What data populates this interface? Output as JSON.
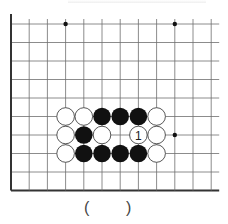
{
  "diagram": {
    "type": "go-problem",
    "board": {
      "edges_visible": [
        "left",
        "bottom"
      ],
      "columns_visible": 12,
      "rows_visible": 10,
      "origin_px": {
        "x": 11,
        "y": 24
      },
      "spacing_px": {
        "x": 18.2,
        "y": 18.5
      },
      "line_color": "#6e6e6e",
      "edge_color": "#333333",
      "star_points": [
        {
          "col": 3,
          "row": 0
        },
        {
          "col": 9,
          "row": 0
        },
        {
          "col": 9,
          "row": 6
        }
      ]
    },
    "stones": [
      {
        "col": 3,
        "row": 5,
        "color": "white",
        "label": ""
      },
      {
        "col": 4,
        "row": 5,
        "color": "white",
        "label": ""
      },
      {
        "col": 5,
        "row": 5,
        "color": "black",
        "label": ""
      },
      {
        "col": 6,
        "row": 5,
        "color": "black",
        "label": ""
      },
      {
        "col": 7,
        "row": 5,
        "color": "black",
        "label": ""
      },
      {
        "col": 8,
        "row": 5,
        "color": "white",
        "label": ""
      },
      {
        "col": 3,
        "row": 6,
        "color": "white",
        "label": ""
      },
      {
        "col": 4,
        "row": 6,
        "color": "black",
        "label": ""
      },
      {
        "col": 5,
        "row": 6,
        "color": "white",
        "label": ""
      },
      {
        "col": 7,
        "row": 6,
        "color": "white",
        "label": "1"
      },
      {
        "col": 8,
        "row": 6,
        "color": "white",
        "label": ""
      },
      {
        "col": 3,
        "row": 7,
        "color": "white",
        "label": ""
      },
      {
        "col": 4,
        "row": 7,
        "color": "black",
        "label": ""
      },
      {
        "col": 5,
        "row": 7,
        "color": "black",
        "label": ""
      },
      {
        "col": 6,
        "row": 7,
        "color": "black",
        "label": ""
      },
      {
        "col": 7,
        "row": 7,
        "color": "black",
        "label": ""
      },
      {
        "col": 8,
        "row": 7,
        "color": "white",
        "label": ""
      }
    ],
    "colors": {
      "black_stone": "#111111",
      "white_stone_fill": "#ffffff",
      "white_stone_stroke": "#444444",
      "label_color": "#222222"
    }
  },
  "answer": {
    "open_paren": "(",
    "close_paren": ")"
  }
}
